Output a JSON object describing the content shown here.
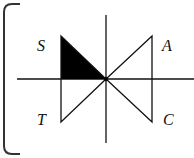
{
  "diagram": {
    "type": "valve-symbol",
    "labels": {
      "top_left": "S",
      "top_right": "A",
      "bottom_left": "T",
      "bottom_right": "C"
    },
    "colors": {
      "stroke": "#111111",
      "fill": "#000000",
      "border": "#333333",
      "background": "#ffffff"
    },
    "center": [
      106,
      79
    ],
    "filled_region": "S"
  }
}
